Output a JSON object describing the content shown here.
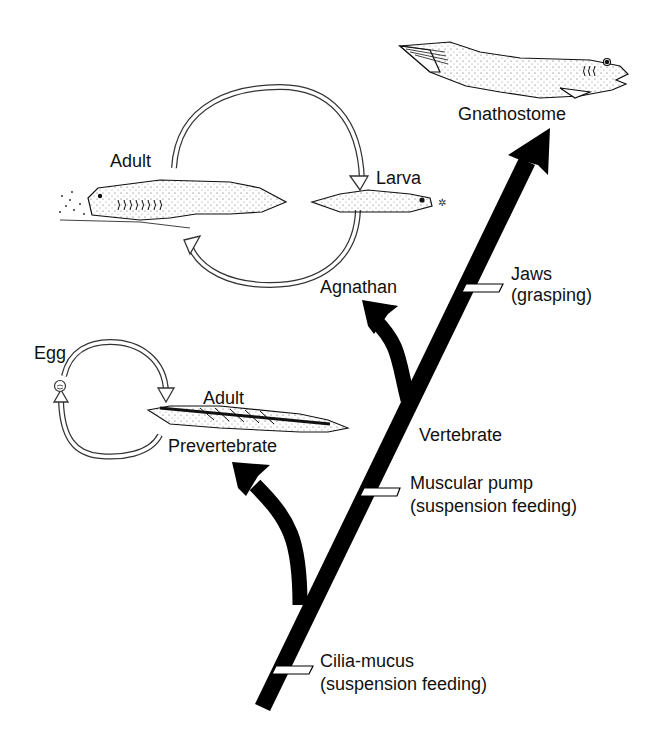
{
  "diagram": {
    "type": "evolutionary-tree",
    "colors": {
      "trunk": "#000000",
      "background": "#ffffff",
      "ink": "#111111",
      "marker_fill": "#ffffff"
    },
    "lineages": {
      "gnathostome": {
        "label": "Gnathostome"
      },
      "agnathan": {
        "label": "Agnathan",
        "life_cycle": {
          "stage_1": "Adult",
          "stage_2": "Larva"
        }
      },
      "prevertebrate": {
        "label": "Prevertebrate",
        "life_cycle": {
          "stage_1": "Egg",
          "stage_2": "Adult"
        }
      }
    },
    "clade_labels": {
      "vertebrate": "Vertebrate"
    },
    "innovations": [
      {
        "name": "Jaws",
        "detail": "(grasping)"
      },
      {
        "name": "Muscular pump",
        "detail": "(suspension feeding)"
      },
      {
        "name": "Cilia-mucus",
        "detail": "(suspension feeding)"
      }
    ]
  }
}
